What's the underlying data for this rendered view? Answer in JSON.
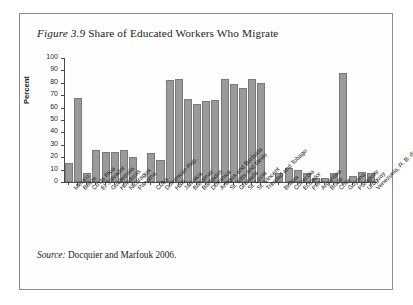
{
  "figure": {
    "number": "Figure 3.9",
    "title": " Share of Educated Workers Who Migrate",
    "source_label": "Source:",
    "source_text": " Docquier and Marfouk 2006."
  },
  "chart_data": {
    "type": "bar",
    "title": "Share of Educated Workers Who Migrate",
    "xlabel": "",
    "ylabel": "Percent",
    "ylim": [
      0,
      100
    ],
    "yticks": [
      0,
      10,
      20,
      30,
      40,
      50,
      60,
      70,
      80,
      90,
      100
    ],
    "grid": false,
    "legend": "none",
    "bar_color": "#9a9a9a",
    "bar_edge_color": "#7a7a7a",
    "group_gaps_after": [
      7,
      20
    ],
    "categories": [
      "Mexico",
      "Belize",
      "Costa Rica",
      "El Salvador",
      "Guatemala",
      "Honduras",
      "Nicaragua",
      "Panama",
      "Cuba",
      "Dominican Rep.",
      "Haiti",
      "Jamaica",
      "Bahamas",
      "Barbados",
      "Dominica",
      "Antigua and Barbuda",
      "St. Kitts and Nevis",
      "Grenada",
      "St. Lucia",
      "St. Vincent",
      "Trinidad and Tobago",
      "Bolivia",
      "Colombia",
      "Ecuador",
      "Peru",
      "Argentina",
      "Brazil",
      "Chile",
      "Guyana",
      "Paraguay",
      "Uruguay",
      "Venezuela, R. B. de"
    ],
    "values": [
      15,
      68,
      7,
      26,
      24,
      24,
      26,
      20,
      23,
      18,
      82,
      83,
      67,
      63,
      65,
      66,
      83,
      79,
      76,
      83,
      80,
      7,
      11,
      10,
      7,
      3,
      3,
      7,
      88,
      5,
      8,
      7
    ]
  }
}
